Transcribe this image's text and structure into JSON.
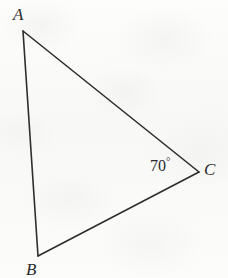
{
  "figure": {
    "type": "geometry-diagram",
    "shape": "triangle",
    "background_color": "#fbfbfa",
    "stroke_color": "#2e2e2e",
    "stroke_width": 1.6,
    "width": 228,
    "height": 278
  },
  "vertices": [
    {
      "name": "A",
      "label": "A",
      "x": 23,
      "y": 31
    },
    {
      "name": "B",
      "label": "B",
      "x": 38,
      "y": 256
    },
    {
      "name": "C",
      "label": "C",
      "x": 199,
      "y": 172
    }
  ],
  "edges": [
    {
      "name": "AB",
      "from": "A",
      "to": "B"
    },
    {
      "name": "AC",
      "from": "A",
      "to": "C"
    },
    {
      "name": "BC",
      "from": "B",
      "to": "C"
    }
  ],
  "angles": [
    {
      "at_vertex": "C",
      "value": 70,
      "unit": "degrees",
      "text": "70",
      "degree_symbol": "°"
    }
  ],
  "labels": {
    "A": "A",
    "B": "B",
    "C": "C",
    "angle_C_value": "70",
    "angle_C_degree": "°"
  }
}
